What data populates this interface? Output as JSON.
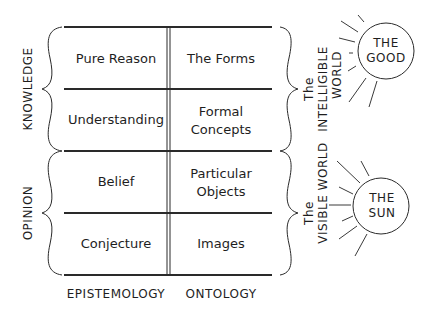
{
  "diagram": {
    "columns": [
      "EPISTEMOLOGY",
      "ONTOLOGY"
    ],
    "rows": [
      {
        "epistemology": "Pure Reason",
        "ontology": [
          "The Forms"
        ]
      },
      {
        "epistemology": "Understanding",
        "ontology": [
          "Formal",
          "Concepts"
        ]
      },
      {
        "epistemology": "Belief",
        "ontology": [
          "Particular",
          "Objects"
        ]
      },
      {
        "epistemology": "Conjecture",
        "ontology": [
          "Images"
        ]
      }
    ],
    "left_groups": [
      "KNOWLEDGE",
      "OPINION"
    ],
    "right_groups": [
      {
        "article": "The",
        "lines": [
          "INTELLIGIBLE",
          "WORLD"
        ]
      },
      {
        "article": "The",
        "lines": [
          "VISIBLE WORLD"
        ]
      }
    ],
    "suns": [
      {
        "lines": [
          "THE",
          "GOOD"
        ]
      },
      {
        "lines": [
          "THE",
          "SUN"
        ]
      }
    ]
  }
}
